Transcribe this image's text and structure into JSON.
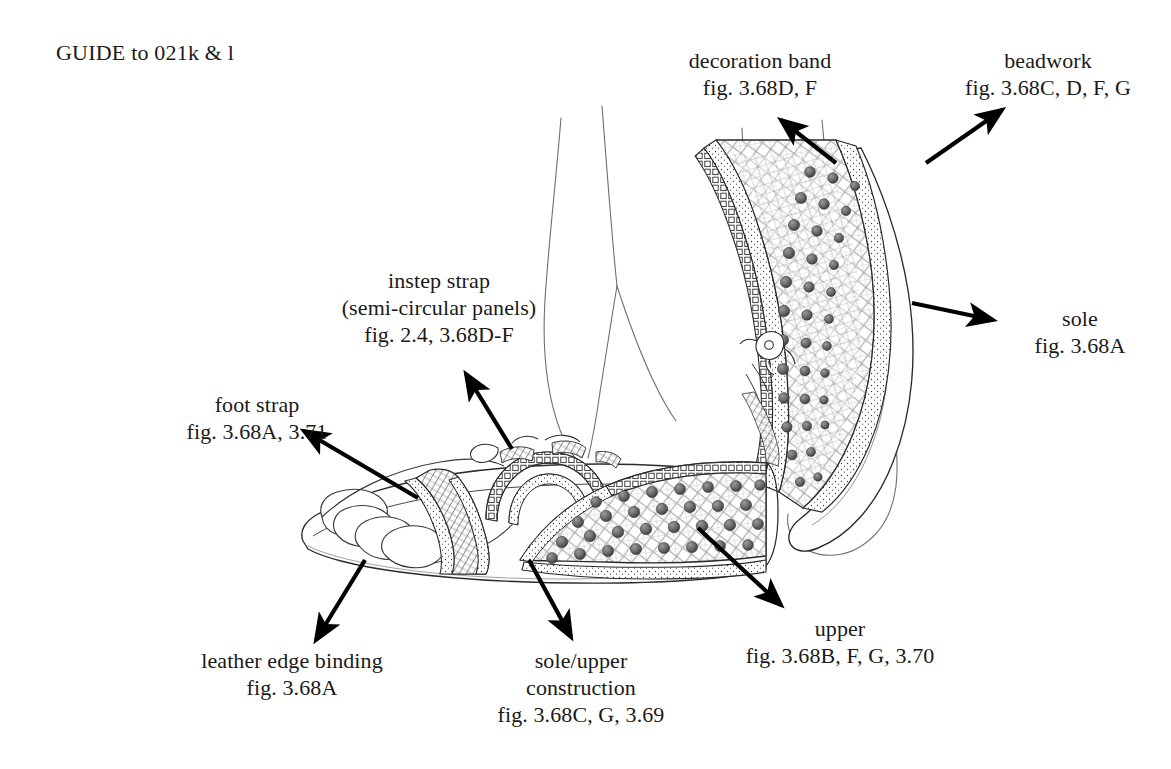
{
  "page": {
    "caption": "GUIDE to 021k & l",
    "background_color": "#ffffff",
    "ink_color": "#1a1a1a"
  },
  "labels": [
    {
      "id": "decoration-band",
      "lines": [
        "decoration band",
        "fig. 3.68D, F"
      ],
      "title": "decoration band",
      "figref": "fig. 3.68D, F"
    },
    {
      "id": "beadwork",
      "lines": [
        "beadwork",
        "fig. 3.68C, D, F, G"
      ],
      "title": "beadwork",
      "figref": "fig. 3.68C, D, F, G"
    },
    {
      "id": "instep-strap",
      "lines": [
        "instep strap",
        "(semi-circular panels)",
        "fig. 2.4, 3.68D-F"
      ],
      "title": "instep strap",
      "subtitle": "(semi-circular panels)",
      "figref": "fig. 2.4, 3.68D-F"
    },
    {
      "id": "sole",
      "lines": [
        "sole",
        "fig. 3.68A"
      ],
      "title": "sole",
      "figref": "fig. 3.68A"
    },
    {
      "id": "foot-strap",
      "lines": [
        "foot strap",
        "fig. 3.68A, 3.71"
      ],
      "title": "foot strap",
      "figref": "fig. 3.68A, 3.71"
    },
    {
      "id": "leather-edge-binding",
      "lines": [
        "leather edge binding",
        "fig. 3.68A"
      ],
      "title": "leather edge binding",
      "figref": "fig. 3.68A"
    },
    {
      "id": "sole-upper-construction",
      "lines": [
        "sole/upper",
        "construction",
        "fig. 3.68C, G, 3.69"
      ],
      "title": "sole/upper",
      "subtitle": "construction",
      "figref": "fig. 3.68C, G, 3.69"
    },
    {
      "id": "upper",
      "lines": [
        "upper",
        "fig. 3.68B, F, G, 3.70"
      ],
      "title": "upper",
      "figref": "fig. 3.68B, F, G, 3.70"
    }
  ],
  "label_text": {
    "decoration_band_l1": "decoration band",
    "decoration_band_l2": "fig. 3.68D, F",
    "beadwork_l1": "beadwork",
    "beadwork_l2": "fig. 3.68C, D, F, G",
    "instep_l1": "instep strap",
    "instep_l2": "(semi-circular panels)",
    "instep_l3": "fig. 2.4, 3.68D-F",
    "sole_l1": "sole",
    "sole_l2": "fig. 3.68A",
    "footstrap_l1": "foot strap",
    "footstrap_l2": "fig. 3.68A, 3.71",
    "leather_l1": "leather edge binding",
    "leather_l2": "fig. 3.68A",
    "soleupper_l1": "sole/upper",
    "soleupper_l2": "construction",
    "soleupper_l3": "fig. 3.68C, G, 3.69",
    "upper_l1": "upper",
    "upper_l2": "fig. 3.68B, F, G, 3.70"
  },
  "illustration": {
    "description": "Pen-and-ink line drawing of a pair of beaded leather sandals worn on feet; left foot shown in side profile resting flat, right foot raised showing the sole and beaded upper",
    "style": "line art, hatched / diaper lattice shading with round bead dots",
    "subjects": [
      {
        "id": "left-sandal",
        "view": "side profile, flat on ground"
      },
      {
        "id": "right-sandal",
        "view": "raised, sole and outer upper visible"
      }
    ],
    "arrows": [
      {
        "id": "arrow-decoration-band",
        "from": [
          800,
          128
        ],
        "to": [
          778,
          118
        ],
        "direction": "up-left",
        "target": "decoration band on raised sandal"
      },
      {
        "id": "arrow-beadwork",
        "from": [
          925,
          165
        ],
        "to": [
          1000,
          110
        ],
        "direction": "up-right",
        "target": "beaded upper of raised sandal"
      },
      {
        "id": "arrow-sole",
        "from": [
          912,
          303
        ],
        "to": [
          996,
          321
        ],
        "direction": "right",
        "target": "sole edge of raised sandal"
      },
      {
        "id": "arrow-instep-strap",
        "from": [
          510,
          447
        ],
        "to": [
          464,
          372
        ],
        "direction": "up-left",
        "target": "instep strap of left sandal"
      },
      {
        "id": "arrow-foot-strap",
        "from": [
          415,
          497
        ],
        "to": [
          303,
          430
        ],
        "direction": "up-left",
        "target": "foot strap over toes"
      },
      {
        "id": "arrow-leather-edge-binding",
        "from": [
          364,
          561
        ],
        "to": [
          315,
          641
        ],
        "direction": "down-left",
        "target": "edge binding at sole rim"
      },
      {
        "id": "arrow-sole-upper-construction",
        "from": [
          530,
          560
        ],
        "to": [
          570,
          638
        ],
        "direction": "down-right",
        "target": "sole/upper junction"
      },
      {
        "id": "arrow-upper",
        "from": [
          697,
          527
        ],
        "to": [
          782,
          606
        ],
        "direction": "down-right",
        "target": "beaded upper of left sandal"
      }
    ]
  }
}
